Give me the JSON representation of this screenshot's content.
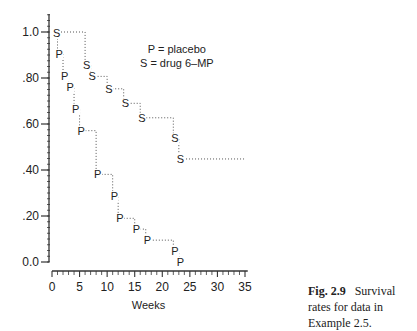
{
  "chart_data": {
    "type": "line",
    "subtype": "step (Kaplan-Meier survival curves)",
    "title": "",
    "xlabel": "Weeks",
    "ylabel": "",
    "xlim": [
      0,
      35
    ],
    "ylim": [
      0.0,
      1.0
    ],
    "x_ticks": [
      0,
      5,
      10,
      15,
      20,
      25,
      30,
      35
    ],
    "x_tick_labels": [
      "0",
      "5",
      "10",
      "15",
      "20",
      "25",
      "30",
      "35"
    ],
    "y_ticks": [
      0.0,
      0.2,
      0.4,
      0.6,
      0.8,
      1.0
    ],
    "y_tick_labels": [
      "0.0",
      ".20",
      ".40",
      ".60",
      ".80",
      "1.0"
    ],
    "grid": false,
    "line_style": "dotted",
    "legend_position": "upper right (inside plot)",
    "series": [
      {
        "name": "P = placebo",
        "marker": "P",
        "x": [
          0,
          1,
          2,
          3,
          4,
          5,
          8,
          11,
          12,
          15,
          17,
          22,
          23
        ],
        "values": [
          1.0,
          0.905,
          0.81,
          0.762,
          0.667,
          0.571,
          0.381,
          0.286,
          0.19,
          0.143,
          0.095,
          0.048,
          0.0
        ]
      },
      {
        "name": "S = drug 6-MP",
        "marker": "S",
        "x": [
          0,
          6,
          7,
          10,
          13,
          16,
          22,
          23,
          35
        ],
        "values": [
          1.0,
          0.857,
          0.807,
          0.753,
          0.69,
          0.627,
          0.538,
          0.448,
          0.448
        ]
      }
    ]
  },
  "legend": {
    "line1": "P = placebo",
    "line2": "S = drug 6–MP"
  },
  "axes": {
    "xlabel": "Weeks"
  },
  "caption": {
    "fig_label": "Fig. 2.9",
    "text": "Survival rates for data in Example 2.5."
  }
}
